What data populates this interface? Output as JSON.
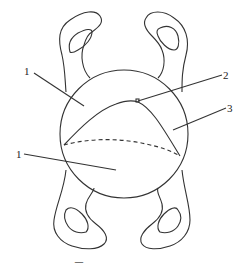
{
  "diagram": {
    "labels": [
      {
        "id": "1",
        "text": "1",
        "position": "upper-left"
      },
      {
        "id": "2",
        "text": "2",
        "position": "upper-right"
      },
      {
        "id": "3",
        "text": "3",
        "position": "right"
      },
      {
        "id": "1b",
        "text": "1",
        "position": "lower-left"
      }
    ],
    "elements": {
      "central_shape": "circle",
      "inner_curve": "solid",
      "inner_boundary": "dashed",
      "outer_loops": 4
    },
    "colors": {
      "stroke": "#333333",
      "background": "#ffffff"
    }
  },
  "caption": {
    "text": "图 14.2 …… ……"
  }
}
